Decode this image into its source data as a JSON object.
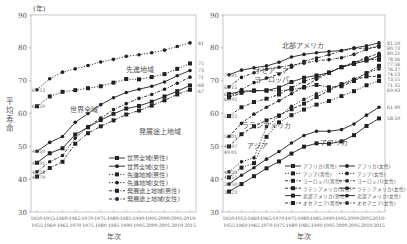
{
  "chart_data": [
    {
      "type": "line",
      "title": "",
      "unit_label": "(年)",
      "ylabel": "平均寿命",
      "xlabel": "年次",
      "ylim": [
        30,
        90
      ],
      "yticks": [
        30,
        40,
        50,
        60,
        70,
        80,
        90
      ],
      "grid": false,
      "legend_position": "lower right inside",
      "categories": [
        "1950-1955",
        "1955-1960",
        "1960-1965",
        "1965-1970",
        "1970-1975",
        "1975-1980",
        "1980-1985",
        "1985-1990",
        "1990-1995",
        "1995-2000",
        "2000-2005",
        "2005-2010",
        "2010-2015"
      ],
      "x_tick_top": [
        "1950-",
        "1955-",
        "1960-",
        "1965-",
        "1970-",
        "1975-",
        "1980-",
        "1985-",
        "1990-",
        "1995-",
        "2000-",
        "2005-",
        "2010-"
      ],
      "x_tick_bottom": [
        "1955",
        "1960",
        "1965",
        "1970",
        "1975",
        "1980",
        "1985",
        "1990",
        "1995",
        "2000",
        "2005",
        "2010",
        "2015"
      ],
      "annotations": [
        {
          "text": "先進地域",
          "x": 7.0,
          "y": 72.5
        },
        {
          "text": "世界全域",
          "x": 2.6,
          "y": 60.6
        },
        {
          "text": "発展途上地域",
          "x": 8.0,
          "y": 53.8
        }
      ],
      "start_labels": [
        "67.23",
        "62.20",
        "48.50",
        "45.01",
        "42.28",
        "40.79"
      ],
      "end_labels": [
        "81.50",
        "75.24",
        "73.11",
        "71.07",
        "68.55",
        "67.23"
      ],
      "series": [
        {
          "name": "世界全域(男性)",
          "style": "solid",
          "marker": "square",
          "values": [
            45.01,
            47.9,
            49.4,
            53.6,
            55.8,
            58.0,
            59.9,
            61.5,
            62.3,
            63.6,
            65.2,
            66.8,
            68.55
          ]
        },
        {
          "name": "世界全域(女性)",
          "style": "solid",
          "marker": "circle",
          "values": [
            48.5,
            51.2,
            53.0,
            57.3,
            60.0,
            62.7,
            64.8,
            66.4,
            67.4,
            68.3,
            69.6,
            71.5,
            73.11
          ]
        },
        {
          "name": "先進地域(男性)",
          "style": "dotted",
          "marker": "square",
          "values": [
            62.2,
            65.2,
            66.6,
            67.1,
            67.7,
            68.3,
            69.4,
            70.5,
            70.4,
            71.1,
            72.0,
            73.6,
            75.24
          ]
        },
        {
          "name": "先進地域(女性)",
          "style": "dotted",
          "marker": "circle",
          "values": [
            67.23,
            70.6,
            72.6,
            73.6,
            74.6,
            75.7,
            76.5,
            77.4,
            77.9,
            78.5,
            79.3,
            80.4,
            81.5
          ]
        },
        {
          "name": "発展途上地域(男性)",
          "style": "dashdot",
          "marker": "square",
          "values": [
            40.79,
            43.4,
            45.3,
            50.8,
            54.0,
            56.1,
            57.9,
            59.7,
            60.9,
            62.4,
            64.0,
            65.8,
            67.23
          ]
        },
        {
          "name": "発展途上地域(女性)",
          "style": "dashdot",
          "marker": "circle",
          "values": [
            42.28,
            45.3,
            47.2,
            52.5,
            56.0,
            58.6,
            61.2,
            63.0,
            64.6,
            65.8,
            67.4,
            69.2,
            71.07
          ]
        }
      ]
    },
    {
      "type": "line",
      "title": "",
      "unit_label": "",
      "ylabel": "",
      "xlabel": "年次",
      "ylim": [
        30,
        90
      ],
      "yticks": [
        30,
        40,
        50,
        60,
        70,
        80,
        90
      ],
      "grid": false,
      "legend_position": "lower right inside (2 columns)",
      "categories": [
        "1950-1955",
        "1955-1960",
        "1960-1965",
        "1965-1970",
        "1970-1975",
        "1975-1980",
        "1980-1985",
        "1985-1990",
        "1990-1995",
        "1995-2000",
        "2000-2005",
        "2005-2010",
        "2010-2015"
      ],
      "x_tick_top": [
        "1950-",
        "1955-",
        "1960-",
        "1965-",
        "1970-",
        "1975-",
        "1980-",
        "1985-",
        "1990-",
        "1995-",
        "2000-",
        "2005-",
        "2010-"
      ],
      "x_tick_bottom": [
        "1955",
        "1960",
        "1965",
        "1970",
        "1975",
        "1980",
        "1985",
        "1990",
        "1995",
        "2000",
        "2005",
        "2010",
        "2015"
      ],
      "annotations": [
        {
          "text": "北部アメリカ",
          "x": 4.2,
          "y": 79.8
        },
        {
          "text": "オセアニア",
          "x": 2.0,
          "y": 72.2
        },
        {
          "text": "ヨーロッパ",
          "x": 2.0,
          "y": 69.6
        },
        {
          "text": "ラテンアメリカ",
          "x": 1.0,
          "y": 55.6
        },
        {
          "text": "アジア",
          "x": 1.4,
          "y": 49.5
        },
        {
          "text": "アフリカ",
          "x": 7.3,
          "y": 50.3
        }
      ],
      "start_labels": [
        "71.81",
        "68.15",
        "65.92",
        "64.92",
        "59.22",
        "49.97",
        "53.01",
        "49.01",
        "42.25",
        "40.53",
        "38.50",
        "36.23"
      ],
      "end_labels": [
        "81.50",
        "80.73",
        "80.21",
        "78.36",
        "77.56",
        "76.37",
        "74.53",
        "73.55",
        "71.35",
        "69.93",
        "61.90",
        "58.50"
      ],
      "series": [
        {
          "name": "アフリカ(男性)",
          "style": "solid",
          "marker": "square",
          "values": [
            36.23,
            38.5,
            40.9,
            43.3,
            45.4,
            47.8,
            49.9,
            50.9,
            50.8,
            51.5,
            53.4,
            56.2,
            58.5
          ]
        },
        {
          "name": "アジア(男性)",
          "style": "dotted",
          "marker": "square",
          "values": [
            40.53,
            43.5,
            44.9,
            52.9,
            57.3,
            59.5,
            61.2,
            62.7,
            63.8,
            65.3,
            66.8,
            68.6,
            69.93
          ]
        },
        {
          "name": "ヨーロッパ(男性)",
          "style": "dashdot",
          "marker": "square",
          "values": [
            64.92,
            66.3,
            67.0,
            67.0,
            66.9,
            67.3,
            67.9,
            68.7,
            68.0,
            68.3,
            69.9,
            72.3,
            74.53
          ]
        },
        {
          "name": "ラテンアメリカ(男性)",
          "style": "dashed",
          "marker": "square",
          "values": [
            49.97,
            53.7,
            56.1,
            57.9,
            59.4,
            61.3,
            63.0,
            65.0,
            67.0,
            68.9,
            70.2,
            71.3,
            71.35
          ]
        },
        {
          "name": "北部アメリカ(男性)",
          "style": "solid",
          "marker": "square",
          "values": [
            65.92,
            66.8,
            66.9,
            67.0,
            67.9,
            69.6,
            70.9,
            71.6,
            72.4,
            74.1,
            75.1,
            76.1,
            77.56
          ]
        },
        {
          "name": "オセアニア(男性)",
          "style": "dashdot",
          "marker": "square",
          "values": [
            59.22,
            61.9,
            63.5,
            64.5,
            65.8,
            67.8,
            69.8,
            71.0,
            72.5,
            74.1,
            75.4,
            76.6,
            76.37
          ]
        },
        {
          "name": "アフリカ(女性)",
          "style": "solid",
          "marker": "circle",
          "values": [
            38.5,
            41.2,
            43.5,
            46.1,
            48.4,
            51.0,
            53.3,
            54.6,
            54.6,
            55.1,
            56.8,
            59.5,
            61.9
          ]
        },
        {
          "name": "アジア(女性)",
          "style": "dotted",
          "marker": "circle",
          "values": [
            42.25,
            45.3,
            46.5,
            56.0,
            59.2,
            62.2,
            64.3,
            66.0,
            67.5,
            69.0,
            70.5,
            72.3,
            73.55
          ]
        },
        {
          "name": "ヨーロッパ(女性)",
          "style": "dashdot",
          "marker": "circle",
          "values": [
            68.15,
            71.0,
            72.4,
            73.5,
            74.1,
            74.7,
            75.3,
            76.1,
            76.4,
            77.0,
            78.0,
            79.5,
            80.73
          ]
        },
        {
          "name": "ラテンアメリカ(女性)",
          "style": "dashed",
          "marker": "circle",
          "values": [
            53.01,
            57.0,
            59.8,
            61.9,
            63.9,
            66.0,
            68.2,
            70.4,
            72.4,
            74.3,
            75.5,
            77.0,
            78.36
          ]
        },
        {
          "name": "北部アメリカ(女性)",
          "style": "solid",
          "marker": "circle",
          "values": [
            71.81,
            73.2,
            73.9,
            74.5,
            75.6,
            77.2,
            78.0,
            78.5,
            78.9,
            79.2,
            80.0,
            80.6,
            81.5
          ]
        },
        {
          "name": "オセアニア(女性)",
          "style": "dashdot",
          "marker": "circle",
          "values": [
            64.92,
            67.3,
            69.4,
            70.8,
            72.0,
            74.1,
            75.9,
            76.9,
            77.9,
            79.1,
            79.8,
            79.9,
            80.21
          ]
        }
      ]
    }
  ]
}
